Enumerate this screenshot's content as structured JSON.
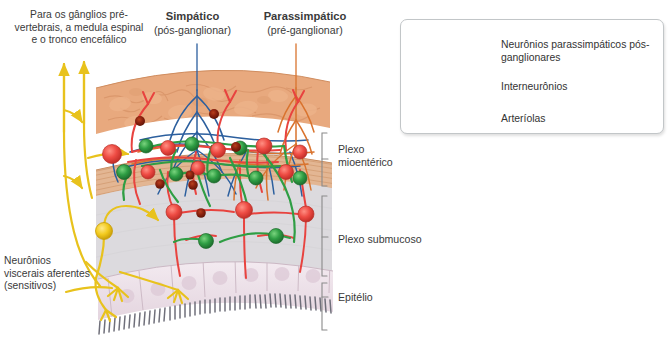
{
  "figure": {
    "type": "anatomical-diagram"
  },
  "labels": {
    "prevertebral": "Para os gânglios pré-vertebrais, a medula espinal e o tronco encefálico",
    "sympathetic_title": "Simpático",
    "sympathetic_sub": "(pós-ganglionar)",
    "parasympathetic_title": "Parassimpático",
    "parasympathetic_sub": "(pré-ganglionar)",
    "afferent": "Neurônios viscerais aferentes (sensitivos)"
  },
  "brackets": [
    {
      "id": "myenteric",
      "label": "Plexo mioentérico"
    },
    {
      "id": "submucoso",
      "label": "Plexo submucoso"
    },
    {
      "id": "epitelio",
      "label": "Epitélio"
    }
  ],
  "legend": {
    "items": [
      {
        "icon": "neuron-red-icon",
        "label": "Neurônios parassimpáticos pós-ganglionares",
        "color": "#e8433f"
      },
      {
        "icon": "neuron-green-icon",
        "label": "Interneurônios",
        "color": "#2f9e44"
      },
      {
        "icon": "arteriole-dot-icon",
        "label": "Arteríolas",
        "color": "#9e2b12"
      }
    ]
  },
  "colors": {
    "sympathetic_fiber": "#2c5f9e",
    "parasympathetic_fiber": "#d9732e",
    "parasympathetic_neuron": "#e8433f",
    "interneuron": "#2f9e44",
    "afferent": "#e8c21c",
    "arteriole": "#9e2b12",
    "longitudinal_muscle": "#e8a97e",
    "circular_muscle": "#e3b693",
    "submucosa": "#dcdade",
    "epithelium": "#ece0e6",
    "bracket": "#8a8a8a"
  },
  "tissue_layers": [
    {
      "name": "Músculo longitudinal",
      "fill": "#e8a97e"
    },
    {
      "name": "Plexo mioentérico",
      "fill": "#ffffff"
    },
    {
      "name": "Músculo circular",
      "fill": "#e3b693"
    },
    {
      "name": "Submucosa",
      "fill": "#dcdade"
    },
    {
      "name": "Epitélio",
      "fill": "#ece0e6"
    }
  ]
}
